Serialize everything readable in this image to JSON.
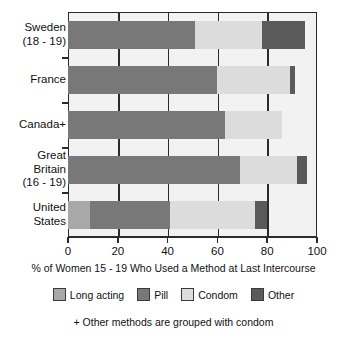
{
  "chart_data": {
    "type": "bar",
    "orientation": "horizontal",
    "stacked": true,
    "title": "",
    "xlabel": "% of Women 15 - 19 Who Used a Method at Last Intercourse",
    "ylabel": "",
    "xlim": [
      0,
      100
    ],
    "grid": true,
    "legend_position": "bottom",
    "footnote": "+ Other methods are grouped with condom",
    "categories": [
      "Sweden\n(18 - 19)",
      "France",
      "Canada+",
      "Great\nBritain\n(16 - 19)",
      "United\nStates"
    ],
    "xticks": [
      0,
      20,
      40,
      60,
      80,
      100
    ],
    "xticklabels": [
      "0",
      "20",
      "40",
      "60",
      "80",
      "100"
    ],
    "series": [
      {
        "name": "Long acting",
        "color": "#a8a8a8",
        "values": [
          0,
          0,
          0,
          0,
          9
        ]
      },
      {
        "name": "Pill",
        "color": "#787878",
        "values": [
          51,
          60,
          63,
          69,
          32
        ]
      },
      {
        "name": "Condom",
        "color": "#dcdcdc",
        "values": [
          27,
          29,
          23,
          23,
          34
        ]
      },
      {
        "name": "Other",
        "color": "#5a5a5a",
        "values": [
          17,
          2,
          0,
          4,
          5
        ]
      }
    ],
    "totals": [
      95,
      91,
      86,
      96,
      80
    ]
  },
  "legend": {
    "items": [
      {
        "label": "Long acting",
        "color": "#a8a8a8"
      },
      {
        "label": "Pill",
        "color": "#787878"
      },
      {
        "label": "Condom",
        "color": "#dcdcdc"
      },
      {
        "label": "Other",
        "color": "#5a5a5a"
      }
    ]
  },
  "colors": {
    "plot_background": "#f2f2f2",
    "axis": "#2b2b2b",
    "text": "#111111",
    "page_background": "#ffffff"
  }
}
